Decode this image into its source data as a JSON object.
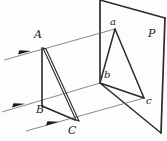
{
  "figure": {
    "type": "geometry-diagram",
    "width": 167,
    "height": 141,
    "background_color": "#fdfdfd",
    "stroke_color": "#1a1a1a",
    "thin_stroke_color": "#55555a"
  },
  "labels": {
    "A": "A",
    "B": "B",
    "C": "C",
    "a": "a",
    "b": "b",
    "c": "c",
    "P": "P"
  },
  "label_positions": {
    "A": {
      "x": 34,
      "y": 38
    },
    "B": {
      "x": 36,
      "y": 113
    },
    "C": {
      "x": 68,
      "y": 134
    },
    "a": {
      "x": 110,
      "y": 25
    },
    "b": {
      "x": 105,
      "y": 78
    },
    "c": {
      "x": 146,
      "y": 103
    },
    "P": {
      "x": 150,
      "y": 35
    }
  },
  "points": {
    "A": {
      "x": 42,
      "y": 48
    },
    "B": {
      "x": 42,
      "y": 106
    },
    "C": {
      "x": 75,
      "y": 120
    },
    "a": {
      "x": 115,
      "y": 29
    },
    "b": {
      "x": 100,
      "y": 83
    },
    "c": {
      "x": 144,
      "y": 98
    },
    "plane_top_left": {
      "x": 100,
      "y": 0
    },
    "plane_top_right": {
      "x": 165,
      "y": 18
    },
    "plane_bottom_right": {
      "x": 161,
      "y": 133
    },
    "plane_bottom_left": {
      "x": 100,
      "y": 83
    }
  },
  "elements": {
    "triangle_object": "ABC",
    "triangle_projection": "abc",
    "plane": "P",
    "projection_rays": [
      "A-a",
      "B-b",
      "C-c"
    ],
    "ray_count": 3,
    "arrow_marker": "arrowhead"
  },
  "notes": {
    "ray_A": "ray through A toward a",
    "ray_B": "ray through B toward b",
    "ray_C": "ray through C toward c"
  }
}
